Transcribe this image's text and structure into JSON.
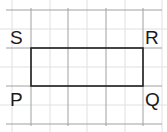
{
  "diagram": {
    "type": "rectangle-on-grid",
    "grid": {
      "vertical_lines_x": [
        12,
        31,
        50,
        68,
        87,
        106,
        125,
        143,
        162
      ],
      "horizontal_lines_y": [
        10,
        29,
        48,
        67,
        86,
        105,
        124
      ],
      "major_color": "#9a9a9a",
      "minor_color": "#dcdcdc"
    },
    "rectangle": {
      "x": 31,
      "y": 48,
      "width": 112,
      "height": 38,
      "stroke": "#222222"
    },
    "labels": {
      "S": "S",
      "R": "R",
      "P": "P",
      "Q": "Q"
    }
  }
}
